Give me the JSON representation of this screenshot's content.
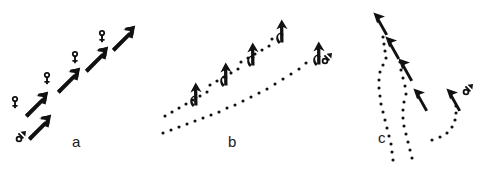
{
  "figure": {
    "width": 484,
    "height": 169,
    "background_color": "#ffffff",
    "ink_color": "#111111",
    "panels": [
      {
        "id": "a",
        "label": "a",
        "label_x": 72,
        "label_y": 134,
        "description": "Ascending chain of straight arrows pointing up-right, each preceded by a sex symbol",
        "elements": [
          {
            "symbol": "male",
            "symbol_glyph": "♂",
            "arrow_angle_deg": -48,
            "arrow_x": 28,
            "arrow_y": 118,
            "symbol_x": 16,
            "symbol_y": 134
          },
          {
            "symbol": "female",
            "symbol_glyph": "♀",
            "arrow_angle_deg": -48,
            "arrow_x": 25,
            "arrow_y": 95,
            "symbol_x": 12,
            "symbol_y": 94
          },
          {
            "symbol": "female",
            "symbol_glyph": "♀",
            "arrow_angle_deg": -48,
            "arrow_x": 57,
            "arrow_y": 71,
            "symbol_x": 44,
            "symbol_y": 72
          },
          {
            "symbol": "female",
            "symbol_glyph": "♀",
            "arrow_angle_deg": -48,
            "arrow_x": 85,
            "arrow_y": 50,
            "symbol_x": 72,
            "symbol_y": 51
          },
          {
            "symbol": "female",
            "symbol_glyph": "♀",
            "arrow_angle_deg": -48,
            "arrow_x": 112,
            "arrow_y": 29,
            "symbol_x": 100,
            "symbol_y": 30
          }
        ]
      },
      {
        "id": "b",
        "label": "b",
        "label_x": 228,
        "label_y": 134,
        "description": "Two dotted trajectories rising to the right, with hook-shaped arrows curving upward; male symbol at the right terminus",
        "elements": [
          {
            "symbol": "none",
            "arrow_angle_deg": 0,
            "arrow_x": 189,
            "arrow_y": 85
          },
          {
            "symbol": "none",
            "arrow_angle_deg": 0,
            "arrow_x": 219,
            "arrow_y": 65
          },
          {
            "symbol": "none",
            "arrow_angle_deg": 0,
            "arrow_x": 246,
            "arrow_y": 45
          },
          {
            "symbol": "none",
            "arrow_angle_deg": 0,
            "arrow_x": 275,
            "arrow_y": 22
          },
          {
            "symbol": "male",
            "symbol_glyph": "♂",
            "arrow_angle_deg": 0,
            "arrow_x": 312,
            "arrow_y": 44,
            "symbol_x": 322,
            "symbol_y": 57
          }
        ]
      },
      {
        "id": "c",
        "label": "c",
        "label_x": 378,
        "label_y": 130,
        "description": "Curved S-shaped dotted trajectories rising vertically, with arrows pointing up-left; male symbol beside the right arrow",
        "elements": [
          {
            "symbol": "none",
            "arrow_angle_deg": -25,
            "arrow_x": 374,
            "arrow_y": 14
          },
          {
            "symbol": "none",
            "arrow_angle_deg": -25,
            "arrow_x": 386,
            "arrow_y": 38
          },
          {
            "symbol": "none",
            "arrow_angle_deg": -25,
            "arrow_x": 399,
            "arrow_y": 60
          },
          {
            "symbol": "none",
            "arrow_angle_deg": -25,
            "arrow_x": 414,
            "arrow_y": 90
          },
          {
            "symbol": "male",
            "symbol_glyph": "♂",
            "arrow_angle_deg": -25,
            "arrow_x": 447,
            "arrow_y": 90,
            "symbol_x": 462,
            "symbol_y": 88
          }
        ]
      }
    ]
  }
}
